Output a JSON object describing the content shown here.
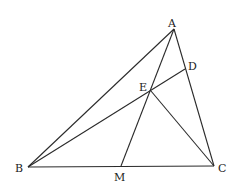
{
  "diagram": {
    "points": {
      "A": {
        "x": 174,
        "y": 29,
        "label": "A",
        "lx": 168,
        "ly": 27
      },
      "B": {
        "x": 28,
        "y": 167,
        "label": "B",
        "lx": 15,
        "ly": 172
      },
      "C": {
        "x": 214,
        "y": 166,
        "label": "C",
        "lx": 218,
        "ly": 172
      },
      "D": {
        "x": 185,
        "y": 69,
        "label": "D",
        "lx": 188,
        "ly": 70
      },
      "E": {
        "x": 151,
        "y": 91,
        "label": "E",
        "lx": 139,
        "ly": 91
      },
      "M": {
        "x": 121,
        "y": 166,
        "label": "M",
        "lx": 114,
        "ly": 181
      }
    },
    "segments": [
      {
        "from": "A",
        "to": "B"
      },
      {
        "from": "A",
        "to": "C"
      },
      {
        "from": "B",
        "to": "C"
      },
      {
        "from": "B",
        "to": "D"
      },
      {
        "from": "A",
        "to": "M"
      },
      {
        "from": "E",
        "to": "C"
      }
    ]
  }
}
